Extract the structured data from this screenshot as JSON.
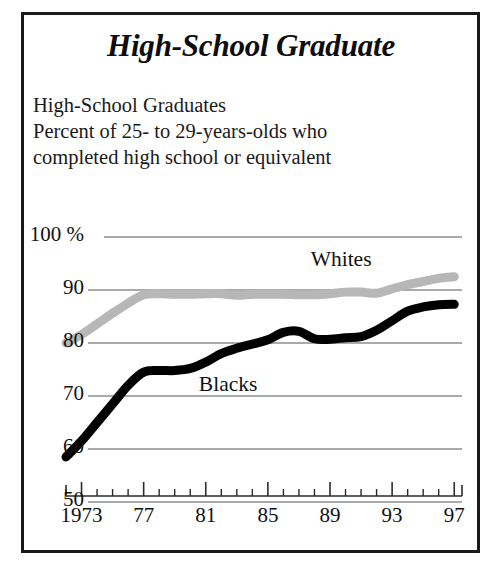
{
  "title": "High-School Graduate",
  "subtitle_lines": [
    "High-School Graduates",
    "Percent of 25- to 29-years-olds who",
    "completed high school or equivalent"
  ],
  "colors": {
    "frame": "#1a1a1a",
    "blacks_line": "#000000",
    "whites_line": "#b7b7b7",
    "gridline": "#55565a",
    "axis": "#2b2b2b",
    "text": "#111111",
    "background": "#ffffff"
  },
  "chart_data": {
    "type": "line",
    "title": "High-School Graduates",
    "subtitle": "Percent of 25- to 29-years-olds who completed high school or equivalent",
    "xlabel": "",
    "ylabel": "",
    "xlim": [
      1972,
      1997.5
    ],
    "ylim": [
      50,
      100
    ],
    "grid": true,
    "grid_axis": "y",
    "legend": "inline-annotations",
    "y_ticks": [
      50,
      60,
      70,
      80,
      90,
      100
    ],
    "y_tick_labels": [
      "50",
      "60",
      "70",
      "80",
      "90",
      "100 %"
    ],
    "x_ticks": [
      1973,
      1977,
      1981,
      1985,
      1989,
      1993,
      1997
    ],
    "x_tick_labels": [
      "1973",
      "77",
      "81",
      "85",
      "89",
      "93",
      "97"
    ],
    "x_minor_ticks": [
      1972,
      1974,
      1975,
      1976,
      1978,
      1979,
      1980,
      1982,
      1983,
      1984,
      1986,
      1987,
      1988,
      1990,
      1991,
      1992,
      1994,
      1995,
      1996
    ],
    "x": [
      1972,
      1973,
      1974,
      1975,
      1976,
      1977,
      1978,
      1979,
      1980,
      1981,
      1982,
      1983,
      1984,
      1985,
      1986,
      1987,
      1988,
      1989,
      1990,
      1991,
      1992,
      1993,
      1994,
      1995,
      1996,
      1997
    ],
    "series": [
      {
        "name": "Whites",
        "color": "#b7b7b7",
        "label_x": 1990.2,
        "label_y": 95.5,
        "values": [
          80.0,
          81.6,
          83.6,
          85.6,
          87.5,
          89.1,
          89.3,
          89.2,
          89.2,
          89.3,
          89.3,
          89.0,
          89.2,
          89.2,
          89.2,
          89.1,
          89.1,
          89.3,
          89.6,
          89.6,
          89.4,
          90.2,
          91.0,
          91.6,
          92.2,
          92.5
        ]
      },
      {
        "name": "Blacks",
        "color": "#000000",
        "label_x": 1983.0,
        "label_y": 71.8,
        "values": [
          58.5,
          61.5,
          65.0,
          68.5,
          72.0,
          74.5,
          74.8,
          74.8,
          75.2,
          76.4,
          78.0,
          79.0,
          79.8,
          80.6,
          82.0,
          82.2,
          80.8,
          80.7,
          81.0,
          81.2,
          82.4,
          84.2,
          86.0,
          86.8,
          87.2,
          87.3
        ]
      }
    ]
  }
}
